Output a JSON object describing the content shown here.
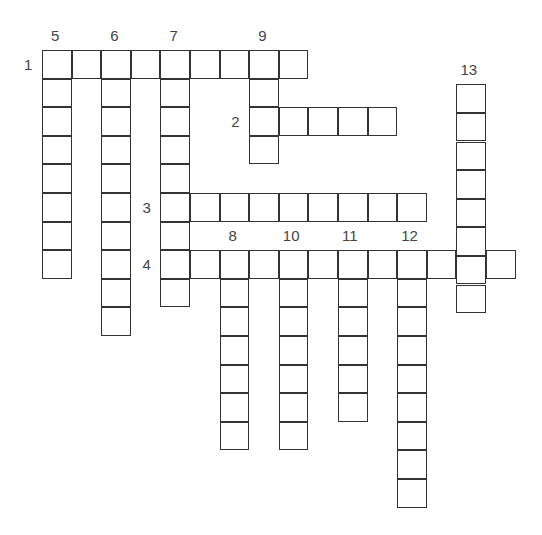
{
  "puzzle": {
    "type": "crossword",
    "grid": {
      "origin_x": 42,
      "origin_y": 50,
      "cell_w": 29.6,
      "cell_h": 28.6
    },
    "across": [
      {
        "number": "1",
        "col": 0,
        "row": 0,
        "length": 9
      },
      {
        "number": "2",
        "col": 7,
        "row": 2,
        "length": 5
      },
      {
        "number": "3",
        "col": 4,
        "row": 5,
        "length": 9
      },
      {
        "number": "4",
        "col": 4,
        "row": 7,
        "length": 12
      }
    ],
    "down": [
      {
        "number": "5",
        "col": 0,
        "row": 0,
        "length": 8
      },
      {
        "number": "6",
        "col": 2,
        "row": 0,
        "length": 10
      },
      {
        "number": "7",
        "col": 4,
        "row": 0,
        "length": 9
      },
      {
        "number": "9",
        "col": 7,
        "row": 0,
        "length": 4
      },
      {
        "number": "8",
        "col": 6,
        "row": 7,
        "length": 7
      },
      {
        "number": "10",
        "col": 8,
        "row": 7,
        "length": 7
      },
      {
        "number": "11",
        "col": 10,
        "row": 7,
        "length": 6
      },
      {
        "number": "12",
        "col": 12,
        "row": 7,
        "length": 9
      },
      {
        "number": "13",
        "col": 14,
        "row": 1.2,
        "length": 8
      }
    ]
  }
}
